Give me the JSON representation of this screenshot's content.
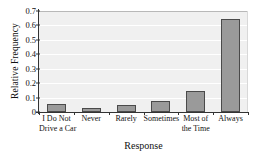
{
  "chart_data": {
    "type": "bar",
    "title": "",
    "xlabel": "Response",
    "ylabel": "Relative Frequency",
    "categories": [
      "I Do Not Drive a Car",
      "Never",
      "Rarely",
      "Sometimes",
      "Most of the Time",
      "Always"
    ],
    "category_lines": [
      [
        "I Do Not",
        "Drive a Car"
      ],
      [
        "Never",
        ""
      ],
      [
        "Rarely",
        ""
      ],
      [
        "Sometimes",
        ""
      ],
      [
        "Most of",
        "the Time"
      ],
      [
        "Always",
        ""
      ]
    ],
    "values": [
      0.056,
      0.027,
      0.052,
      0.075,
      0.148,
      0.642
    ],
    "ylim": [
      0,
      0.7
    ],
    "yticks": [
      0,
      0.1,
      0.2,
      0.3,
      0.4,
      0.5,
      0.6,
      0.7
    ],
    "ytick_labels": [
      "0",
      "0.1",
      "0.2",
      "0.3",
      "0.4",
      "0.5",
      "0.6",
      "0.7"
    ],
    "grid": true,
    "legend": "none",
    "bar_color": "#9a9a9a",
    "bar_edge_color": "#4a4a4a",
    "plot_background": "#f0f0f0",
    "gridline_color": "#ffffff",
    "axis_color": "#333333"
  }
}
